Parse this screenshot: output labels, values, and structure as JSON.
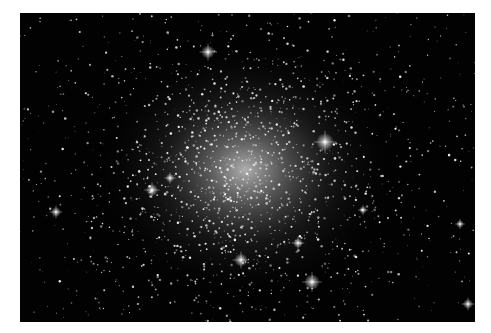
{
  "image": {
    "subject": "globular star cluster",
    "background_color": "#020202",
    "frame_color": "#ffffff",
    "cluster_center": [
      225,
      157
    ],
    "bright_stars": [
      {
        "x": 305,
        "y": 129,
        "r": 3.2
      },
      {
        "x": 292,
        "y": 269,
        "r": 2.8
      },
      {
        "x": 188,
        "y": 39,
        "r": 2.4
      },
      {
        "x": 221,
        "y": 247,
        "r": 2.4
      },
      {
        "x": 132,
        "y": 177,
        "r": 2.2
      },
      {
        "x": 36,
        "y": 199,
        "r": 1.8
      },
      {
        "x": 278,
        "y": 230,
        "r": 1.8
      },
      {
        "x": 448,
        "y": 291,
        "r": 1.8
      },
      {
        "x": 150,
        "y": 165,
        "r": 1.6
      },
      {
        "x": 343,
        "y": 197,
        "r": 1.4
      },
      {
        "x": 440,
        "y": 211,
        "r": 1.4
      }
    ]
  }
}
